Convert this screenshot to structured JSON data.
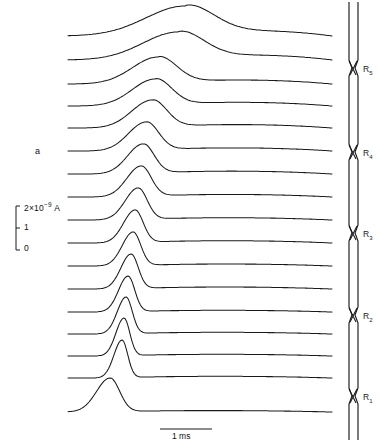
{
  "figure": {
    "panel_label": "a"
  },
  "vertical_scale": {
    "name": "current-scale-bar",
    "top_label_value": "2×10",
    "top_label_exponent": "−9",
    "top_label_unit": "A",
    "top_label_full": "2×10⁻⁹ A",
    "mid_label": "1",
    "bottom_label": "0",
    "ticks": [
      "2×10⁻⁹ A",
      "1",
      "0"
    ]
  },
  "time_scale": {
    "name": "time-scale-bar",
    "label": "1 ms",
    "value": 1,
    "unit": "ms"
  },
  "fibre": {
    "name": "nerve-fibre-diagram",
    "nodes": [
      {
        "label": "R",
        "subscript": "5",
        "full": "R5",
        "y": 68
      },
      {
        "label": "R",
        "subscript": "4",
        "full": "R4",
        "y": 152
      },
      {
        "label": "R",
        "subscript": "3",
        "full": "R3",
        "y": 233
      },
      {
        "label": "R",
        "subscript": "2",
        "full": "R2",
        "y": 315
      },
      {
        "label": "R",
        "subscript": "1",
        "full": "R1",
        "y": 396
      }
    ]
  },
  "chart_data": {
    "type": "line",
    "title": "",
    "subtitle": "",
    "xlabel": "Time",
    "ylabel": "Membrane current",
    "xlim": [
      0,
      4.5
    ],
    "ylim": [
      0,
      2
    ],
    "grid": false,
    "legend": "none",
    "x_unit": "ms",
    "y_unit": "A",
    "y_scale_factor": "1e-9",
    "n_traces": 17,
    "trace_spacing_px": 25,
    "annotations": [
      "a",
      "2×10⁻⁹ A",
      "1",
      "0",
      "1 ms",
      "R1",
      "R2",
      "R3",
      "R4",
      "R5"
    ],
    "series": [
      {
        "name": "trace-1",
        "baseline_y": 36,
        "peak_x": 185,
        "peak_height": 30,
        "peak_width": 58,
        "decay_tail": 18,
        "shape": "broad"
      },
      {
        "name": "trace-2",
        "baseline_y": 60,
        "peak_x": 178,
        "peak_height": 28,
        "peak_width": 52,
        "decay_tail": 17,
        "shape": "broad"
      },
      {
        "name": "trace-3",
        "baseline_y": 84,
        "peak_x": 158,
        "peak_height": 27,
        "peak_width": 38,
        "decay_tail": 14,
        "shape": "rounded"
      },
      {
        "name": "trace-4",
        "baseline_y": 106,
        "peak_x": 155,
        "peak_height": 27,
        "peak_width": 34,
        "decay_tail": 13,
        "shape": "rounded"
      },
      {
        "name": "trace-5",
        "baseline_y": 128,
        "peak_x": 152,
        "peak_height": 28,
        "peak_width": 30,
        "decay_tail": 12,
        "shape": "rounded"
      },
      {
        "name": "trace-6",
        "baseline_y": 151,
        "peak_x": 146,
        "peak_height": 29,
        "peak_width": 26,
        "decay_tail": 11,
        "shape": "peaked"
      },
      {
        "name": "trace-7",
        "baseline_y": 174,
        "peak_x": 143,
        "peak_height": 30,
        "peak_width": 23,
        "decay_tail": 10,
        "shape": "peaked"
      },
      {
        "name": "trace-8",
        "baseline_y": 197,
        "peak_x": 141,
        "peak_height": 31,
        "peak_width": 21,
        "decay_tail": 9,
        "shape": "peaked"
      },
      {
        "name": "trace-9",
        "baseline_y": 220,
        "peak_x": 138,
        "peak_height": 32,
        "peak_width": 19,
        "decay_tail": 8,
        "shape": "sharp"
      },
      {
        "name": "trace-10",
        "baseline_y": 243,
        "peak_x": 135,
        "peak_height": 33,
        "peak_width": 17,
        "decay_tail": 8,
        "shape": "sharp"
      },
      {
        "name": "trace-11",
        "baseline_y": 266,
        "peak_x": 133,
        "peak_height": 34,
        "peak_width": 16,
        "decay_tail": 7,
        "shape": "sharp"
      },
      {
        "name": "trace-12",
        "baseline_y": 289,
        "peak_x": 131,
        "peak_height": 35,
        "peak_width": 15,
        "decay_tail": 7,
        "shape": "sharp"
      },
      {
        "name": "trace-13",
        "baseline_y": 312,
        "peak_x": 128,
        "peak_height": 36,
        "peak_width": 14,
        "decay_tail": 6,
        "shape": "sharp"
      },
      {
        "name": "trace-14",
        "baseline_y": 334,
        "peak_x": 126,
        "peak_height": 37,
        "peak_width": 13,
        "decay_tail": 6,
        "shape": "sharp"
      },
      {
        "name": "trace-15",
        "baseline_y": 356,
        "peak_x": 124,
        "peak_height": 38,
        "peak_width": 12,
        "decay_tail": 6,
        "shape": "sharp"
      },
      {
        "name": "trace-16",
        "baseline_y": 378,
        "peak_x": 122,
        "peak_height": 38,
        "peak_width": 12,
        "decay_tail": 6,
        "shape": "sharp"
      },
      {
        "name": "trace-17",
        "baseline_y": 412,
        "peak_x": 110,
        "peak_height": 34,
        "peak_width": 20,
        "decay_tail": 5,
        "shape": "broad-early"
      }
    ]
  }
}
